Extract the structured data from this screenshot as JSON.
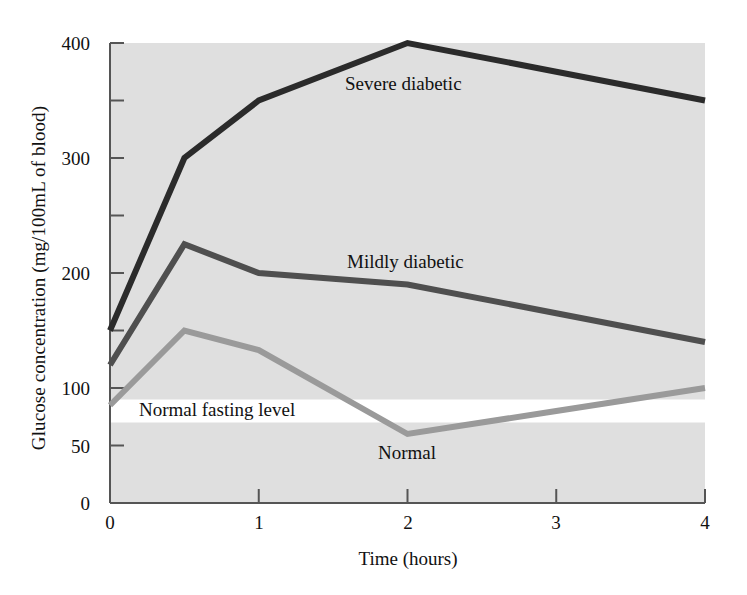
{
  "chart_data": {
    "type": "line",
    "title": "",
    "xlabel": "Time (hours)",
    "ylabel": "Glucose concentration (mg/100mL of blood)",
    "xlim": [
      0,
      4
    ],
    "ylim": [
      0,
      400
    ],
    "grid": false,
    "legend_position": "inline-annotations",
    "background": "#e0e0e0",
    "plot_band": {
      "name": "Normal fasting level",
      "label": "Normal fasting level",
      "from": 70,
      "to": 90,
      "color": "#ffffff"
    },
    "x": [
      0,
      0.5,
      1,
      2,
      3,
      4
    ],
    "xticks": [
      0,
      1,
      2,
      3,
      4
    ],
    "xticklabels": [
      "0",
      "1",
      "2",
      "3",
      "4"
    ],
    "yticks": [
      0,
      50,
      100,
      150,
      200,
      250,
      300,
      350,
      400
    ],
    "yticklabels": [
      "0",
      "50",
      "100",
      "",
      "200",
      "",
      "300",
      "",
      "400"
    ],
    "ytick_labeled": [
      0,
      50,
      100,
      200,
      300,
      400
    ],
    "series": [
      {
        "name": "Severe diabetic",
        "label": "Severe diabetic",
        "color": "#2b2b2b",
        "width": 5,
        "values": [
          150,
          300,
          350,
          400,
          375,
          350
        ]
      },
      {
        "name": "Mildly diabetic",
        "label": "Mildly diabetic",
        "color": "#4f4f4f",
        "width": 5,
        "values": [
          120,
          225,
          200,
          190,
          165,
          140
        ]
      },
      {
        "name": "Normal",
        "label": "Normal",
        "color": "#9a9a9a",
        "width": 5,
        "values": [
          85,
          150,
          133,
          60,
          80,
          100
        ]
      }
    ]
  },
  "axes": {
    "ylabel": "Glucose concentration (mg/100mL of blood)",
    "xlabel": "Time (hours)",
    "ytick_0": "0",
    "ytick_50": "50",
    "ytick_100": "100",
    "ytick_200": "200",
    "ytick_300": "300",
    "ytick_400": "400",
    "xtick_0": "0",
    "xtick_1": "1",
    "xtick_2": "2",
    "xtick_3": "3",
    "xtick_4": "4"
  },
  "annotations": {
    "severe": "Severe diabetic",
    "mildly": "Mildly diabetic",
    "fasting": "Normal fasting level",
    "normal": "Normal"
  },
  "colors": {
    "plot_background": "#e0e0e0",
    "band": "#ffffff",
    "severe_line": "#2b2b2b",
    "mildly_line": "#4f4f4f",
    "normal_line": "#9a9a9a",
    "axis": "#4a4a4a",
    "text": "#111111"
  }
}
